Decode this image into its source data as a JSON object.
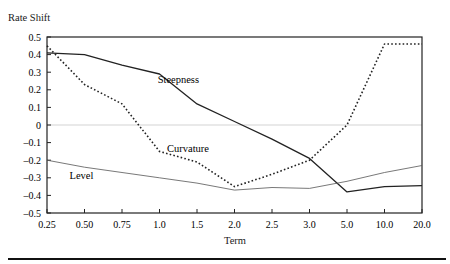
{
  "chart_data": {
    "type": "line",
    "title": "",
    "ylabel": "Rate Shift",
    "xlabel": "Term",
    "categories": [
      "0.25",
      "0.50",
      "0.75",
      "1.0",
      "1.5",
      "2.0",
      "2.5",
      "3.0",
      "5.0",
      "10.0",
      "20.0"
    ],
    "yticks": [
      "0.5",
      "0.4",
      "0.3",
      "0.2",
      "0.1",
      "0",
      "-0.1",
      "-0.2",
      "-0.3",
      "-0.4",
      "-0.5"
    ],
    "ylim": [
      -0.5,
      0.5
    ],
    "grid": false,
    "zero_line": true,
    "legend": "inline labels",
    "series": [
      {
        "name": "Steepness",
        "style": "solid",
        "color": "#222222",
        "width": 1.3,
        "values": [
          0.41,
          0.4,
          0.34,
          0.29,
          0.12,
          0.02,
          -0.08,
          -0.19,
          -0.38,
          -0.35,
          -0.345
        ],
        "label_pos": [
          2.95,
          0.26
        ]
      },
      {
        "name": "Curvature",
        "style": "dotted",
        "color": "#222222",
        "width": 1.6,
        "values": [
          0.45,
          0.23,
          0.12,
          -0.15,
          -0.21,
          -0.35,
          -0.28,
          -0.2,
          0.0,
          0.46,
          0.46
        ],
        "label_pos": [
          3.2,
          -0.13
        ]
      },
      {
        "name": "Level",
        "style": "solid",
        "color": "#555555",
        "width": 0.8,
        "values": [
          -0.2,
          -0.24,
          -0.27,
          -0.3,
          -0.33,
          -0.37,
          -0.355,
          -0.36,
          -0.32,
          -0.27,
          -0.23
        ],
        "label_pos": [
          0.6,
          -0.285
        ]
      }
    ]
  }
}
